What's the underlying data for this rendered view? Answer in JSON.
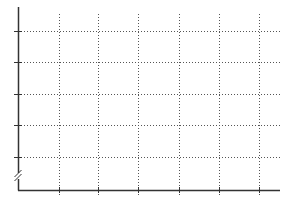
{
  "chart_data": {
    "type": "line",
    "title": "",
    "xlabel": "",
    "ylabel": "",
    "categories": [],
    "series": [],
    "x_tick_labels": [],
    "y_tick_labels": [],
    "grid": true,
    "grid_style": "dotted",
    "legend": null,
    "y_axis_break": true,
    "x_gridline_count": 6,
    "y_gridline_count": 5
  },
  "layout": {
    "plot": {
      "left": 18,
      "right": 280,
      "top": 7,
      "bottom": 190
    },
    "x_grid_px": [
      59,
      98,
      138,
      179,
      219,
      259
    ],
    "y_grid_px": [
      31,
      62,
      94,
      125,
      157
    ],
    "break_marker_y": 176,
    "colors": {
      "axis": "#333333",
      "grid": "#555555",
      "background": "#ffffff"
    }
  }
}
